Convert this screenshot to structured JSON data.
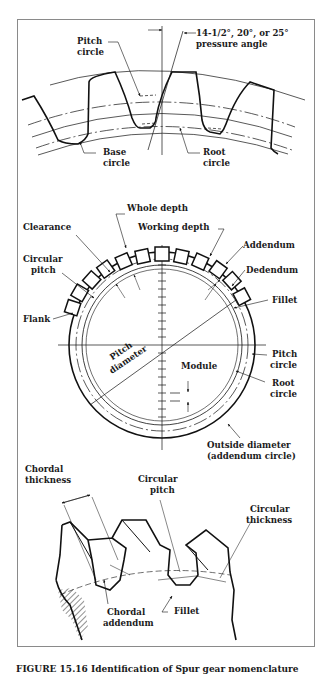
{
  "figure": {
    "caption": "FIGURE 15.16  Identification of Spur gear nomenclature"
  },
  "top_section": {
    "labels": {
      "pitch_circle": [
        "Pitch",
        "circle"
      ],
      "pressure_angle": [
        "14-1/2°, 20°, or 25°",
        "pressure angle"
      ],
      "base_circle": [
        "Base",
        "circle"
      ],
      "root_circle": [
        "Root",
        "circle"
      ]
    }
  },
  "middle_section": {
    "labels": {
      "whole_depth": "Whole depth",
      "clearance": "Clearance",
      "working_depth": "Working depth",
      "addendum": "Addendum",
      "circular_pitch": [
        "Circular",
        "pitch"
      ],
      "dedendum": "Dedendum",
      "fillet": "Fillet",
      "flank": "Flank",
      "pitch_diameter": [
        "Pitch",
        "diameter"
      ],
      "module": "Module",
      "pitch_circle": [
        "Pitch",
        "circle"
      ],
      "root_circle": [
        "Root",
        "circle"
      ],
      "outside_diameter": [
        "Outside diameter",
        "(addendum circle)"
      ]
    }
  },
  "bottom_section": {
    "labels": {
      "chordal_thickness": [
        "Chordal",
        "thickness"
      ],
      "circular_pitch": [
        "Circular",
        "pitch"
      ],
      "circular_thickness": [
        "Circular",
        "thickness"
      ],
      "chordal_addendum": [
        "Chordal",
        "addendum"
      ],
      "fillet": "Fillet"
    }
  }
}
